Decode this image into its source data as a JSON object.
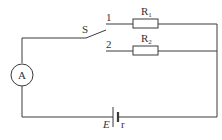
{
  "diagram": {
    "type": "circuit",
    "components": {
      "switch": {
        "label": "S"
      },
      "terminal_1": {
        "label": "1"
      },
      "terminal_2": {
        "label": "2"
      },
      "resistor_1": {
        "label": "R",
        "subscript": "1"
      },
      "resistor_2": {
        "label": "R",
        "subscript": "2"
      },
      "ammeter": {
        "label": "A"
      },
      "battery": {
        "emf_label": "E",
        "internal_resistance_label": "r"
      }
    },
    "colors": {
      "line": "#3a3a3a",
      "background": "#ffffff"
    }
  }
}
